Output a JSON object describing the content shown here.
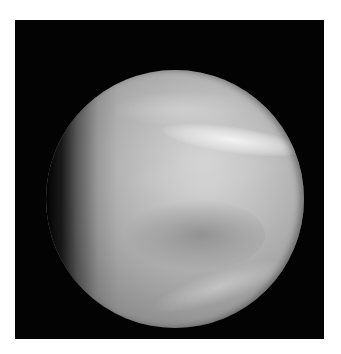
{
  "image": {
    "subject": "planet",
    "description": "Grayscale image of a cloud-covered planet in gibbous phase on a black background",
    "colors": {
      "background": "#030303",
      "border": "#ffffff",
      "planet_highlight": "#ececec",
      "planet_mid": "#a4a4a4",
      "planet_shadow": "#5a5a5a"
    }
  }
}
